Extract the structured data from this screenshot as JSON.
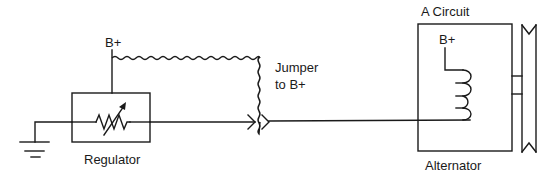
{
  "diagram": {
    "type": "circuit-schematic",
    "labels": {
      "regulator_bplus": "B+",
      "regulator": "Regulator",
      "jumper_line1": "Jumper",
      "jumper_line2": "to B+",
      "circuit_type": "A Circuit",
      "alternator_bplus": "B+",
      "alternator": "Alternator"
    },
    "components": [
      {
        "id": "ground",
        "kind": "ground-symbol"
      },
      {
        "id": "regulator",
        "kind": "box-with-variable-resistor"
      },
      {
        "id": "jumper",
        "kind": "wavy-wire",
        "from": "regulator B+",
        "to": "field connector"
      },
      {
        "id": "connector",
        "kind": "plug-connector"
      },
      {
        "id": "field-coil",
        "kind": "inductor"
      },
      {
        "id": "alternator",
        "kind": "box"
      },
      {
        "id": "pulley",
        "kind": "v-pulley"
      }
    ],
    "colors": {
      "line": "#1a1a1a",
      "background": "#ffffff"
    }
  }
}
